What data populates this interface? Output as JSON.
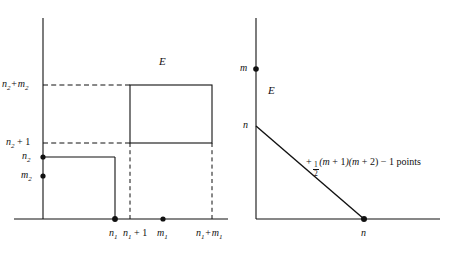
{
  "figure": {
    "type": "mathematical-diagram",
    "left_panel": {
      "region_label": "E",
      "y_axis_labels": [
        {
          "key": "n2_plus_m2",
          "text": "n₂ + m₂",
          "base": "n",
          "sub": "2",
          "expr": "n2+m2"
        },
        {
          "key": "n2_plus_1",
          "text": "n₂ + 1",
          "base": "n",
          "sub": "2",
          "expr": "n2+1"
        },
        {
          "key": "n2",
          "text": "n₂",
          "base": "n",
          "sub": "2",
          "expr": "n2"
        },
        {
          "key": "m2",
          "text": "m₂",
          "base": "m",
          "sub": "2",
          "expr": "m2"
        }
      ],
      "x_axis_labels": [
        {
          "key": "n1",
          "text": "n₁",
          "base": "n",
          "sub": "1",
          "expr": "n1"
        },
        {
          "key": "n1_plus_1",
          "text": "n₁ + 1",
          "base": "n",
          "sub": "1",
          "expr": "n1+1"
        },
        {
          "key": "m1",
          "text": "m₁",
          "base": "m",
          "sub": "1",
          "expr": "m1"
        },
        {
          "key": "n1_plus_m1",
          "text": "n₁ + m₁",
          "base": "n",
          "sub": "1",
          "expr": "n1+m1"
        }
      ],
      "marked_points": [
        "n₂",
        "m₂",
        "n₁",
        "m₁"
      ],
      "shapes": [
        "lower-left-rectangle",
        "upper-right-rectangle"
      ],
      "dashed_guides": [
        "n₂+m₂ horizontal",
        "n₂+1 horizontal",
        "n₁+1 vertical",
        "n₁+m₁ vertical"
      ]
    },
    "right_panel": {
      "region_label": "E",
      "y_axis_labels": [
        {
          "key": "m",
          "text": "m"
        },
        {
          "key": "n",
          "text": "n"
        }
      ],
      "x_axis_labels": [
        {
          "key": "n",
          "text": "n"
        }
      ],
      "marked_points": [
        "m",
        "n"
      ],
      "shapes": [
        "triangle-hypotenuse"
      ],
      "annotation": {
        "prefix": "+",
        "fraction_numerator": "1",
        "fraction_denominator": "2",
        "body": "(m + 1)(m + 2) − 1 points",
        "full_text": "+ 1/2(m + 1)(m + 2) − 1 points"
      }
    },
    "colors": {
      "stroke": "#111111",
      "background": "#ffffff",
      "text": "#111111"
    }
  }
}
